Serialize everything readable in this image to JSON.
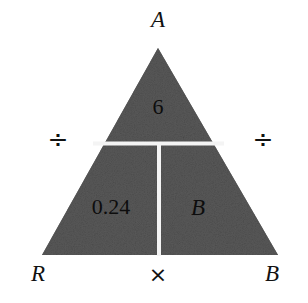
{
  "figure": {
    "type": "math-triangle-diagram",
    "colors": {
      "background": "#ffffff",
      "fill": "#5a5a5a",
      "divider": "#f2f2f2",
      "text": "#111111"
    },
    "outer_labels": {
      "apex": "A",
      "bottom_left": "R",
      "bottom_right": "B"
    },
    "operators": {
      "left": "÷",
      "right": "÷",
      "bottom": "×"
    },
    "cells": {
      "top": "6",
      "bottom_left": "0.24",
      "bottom_right": "B"
    },
    "geometry": {
      "apex_x": 158,
      "apex_y": 48,
      "base_left_x": 42,
      "base_right_x": 278,
      "base_y": 255,
      "divider_y": 143,
      "divider_x": 159
    }
  }
}
